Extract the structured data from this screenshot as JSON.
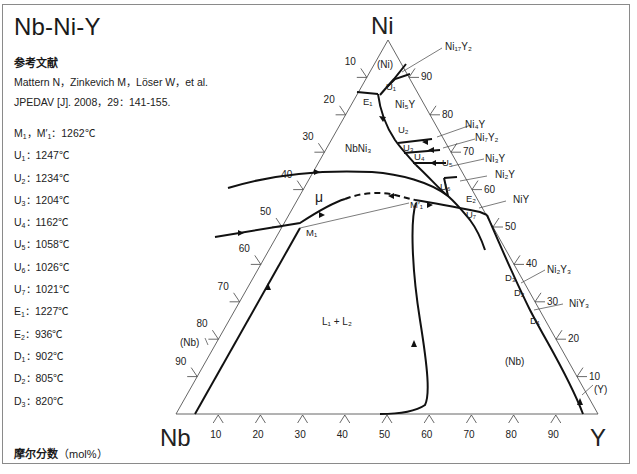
{
  "title": "Nb-Ni-Y",
  "reference": {
    "heading": "参考文献",
    "line1": "Mattern N，Zinkevich M，Löser W，et al.",
    "line2": "JPEDAV [J]. 2008，29：141-155."
  },
  "temperatures": [
    {
      "label": "M",
      "sub": "1",
      "extra": "，M′",
      "extra_sub": "1",
      "value": "：1262℃"
    },
    {
      "label": "U",
      "sub": "1",
      "value": "：1247℃"
    },
    {
      "label": "U",
      "sub": "2",
      "value": "：1234℃"
    },
    {
      "label": "U",
      "sub": "3",
      "value": "：1204℃"
    },
    {
      "label": "U",
      "sub": "4",
      "value": "：1162℃"
    },
    {
      "label": "U",
      "sub": "5",
      "value": "：1058℃"
    },
    {
      "label": "U",
      "sub": "6",
      "value": "：1026℃"
    },
    {
      "label": "U",
      "sub": "7",
      "value": "：1021℃"
    },
    {
      "label": "E",
      "sub": "1",
      "value": "：1227℃"
    },
    {
      "label": "E",
      "sub": "2",
      "value": "：936℃"
    },
    {
      "label": "D",
      "sub": "1",
      "value": "：902℃"
    },
    {
      "label": "D",
      "sub": "2",
      "value": "：805℃"
    },
    {
      "label": "D",
      "sub": "3",
      "value": "：820℃"
    }
  ],
  "footer": {
    "label": "摩尔分数",
    "unit": "（mol%）"
  },
  "diagram": {
    "vertices": {
      "top": "Ni",
      "left": "Nb",
      "right": "Y"
    },
    "left_axis_ticks": [
      "10",
      "20",
      "30",
      "40",
      "50",
      "60",
      "70",
      "80",
      "90"
    ],
    "right_axis_ticks": [
      "90",
      "80",
      "70",
      "60",
      "50",
      "40",
      "30",
      "20",
      "10"
    ],
    "bottom_axis_ticks": [
      "10",
      "20",
      "30",
      "40",
      "50",
      "60",
      "70",
      "80",
      "90"
    ],
    "phase_labels": {
      "ni_solid": "(Ni)",
      "ni5y": "Ni₅Y",
      "nbni3": "NbNi₃",
      "mu": "μ",
      "l1l2": "L₁ + L₂",
      "nb_right": "(Nb)",
      "nb_left": "(Nb)",
      "y_solid": "(Y)"
    },
    "compound_labels": [
      "Ni₁₇Y₂",
      "Ni₄Y",
      "Ni₇Y₂",
      "Ni₃Y",
      "Ni₂Y",
      "NiY",
      "Ni₂Y₃",
      "NiY₃"
    ],
    "point_labels": [
      "U₁",
      "E₁",
      "U₂",
      "U₃",
      "U₄",
      "U₅",
      "U₆",
      "E₂",
      "U₇",
      "M₁",
      "M′₁",
      "D₃",
      "D₂",
      "D₁"
    ]
  }
}
